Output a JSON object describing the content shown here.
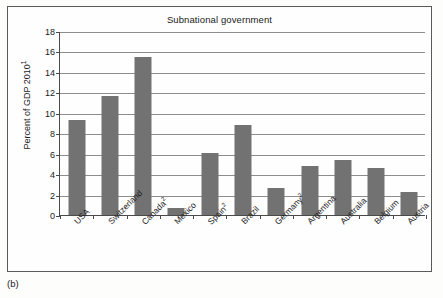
{
  "figure": {
    "caption": "(b)"
  },
  "chart_data": {
    "type": "bar",
    "title": "Subnational government",
    "xlabel": "",
    "ylabel": "Percent of GDP 2010",
    "ylabel_superscript": "1",
    "ylim": [
      0,
      18
    ],
    "yticks": [
      0,
      2,
      4,
      6,
      8,
      10,
      12,
      14,
      16,
      18
    ],
    "ytick_labels": [
      "0",
      "2",
      "4",
      "6",
      "8",
      "10",
      "12",
      "14",
      "16",
      "18"
    ],
    "grid": true,
    "legend": "none",
    "bar_color": "#727272",
    "categories": [
      "USA",
      "Switzerland",
      "Canada²",
      "Mexico",
      "Spain²",
      "Brazil",
      "Germany²",
      "Argentina",
      "Australia",
      "Belgium",
      "Austria"
    ],
    "category_labels": [
      {
        "name": "USA",
        "sup": ""
      },
      {
        "name": "Switzerland",
        "sup": ""
      },
      {
        "name": "Canada",
        "sup": "2"
      },
      {
        "name": "Mexico",
        "sup": ""
      },
      {
        "name": "Spain",
        "sup": "2"
      },
      {
        "name": "Brazil",
        "sup": ""
      },
      {
        "name": "Germany",
        "sup": "2"
      },
      {
        "name": "Argentina",
        "sup": ""
      },
      {
        "name": "Australia",
        "sup": ""
      },
      {
        "name": "Belgium",
        "sup": ""
      },
      {
        "name": "Austria",
        "sup": ""
      }
    ],
    "values": [
      9.3,
      11.6,
      15.45,
      0.7,
      6.1,
      8.85,
      2.6,
      4.8,
      5.35,
      4.6,
      2.3
    ]
  }
}
